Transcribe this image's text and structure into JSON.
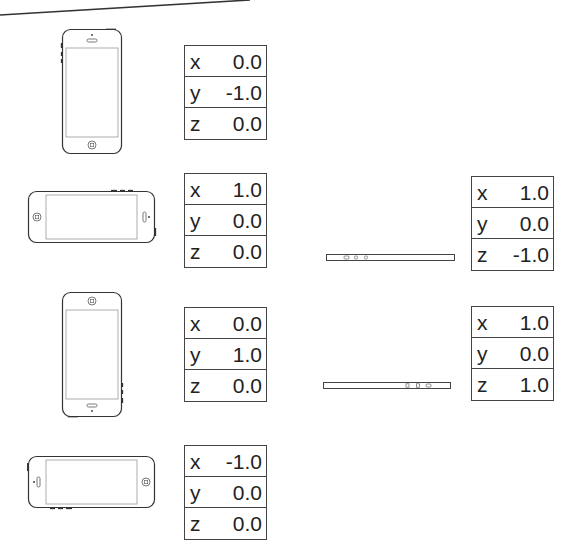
{
  "diagram": {
    "title": "",
    "colors": {
      "stroke": "#444444",
      "text": "#222222",
      "background": "#ffffff"
    },
    "orientations": [
      {
        "id": "portrait",
        "device_icon": "phone-portrait-icon",
        "vector": {
          "x": "0.0",
          "y": "-1.0",
          "z": "0.0"
        }
      },
      {
        "id": "landscape-left",
        "device_icon": "phone-landscape-home-left-icon",
        "vector": {
          "x": "1.0",
          "y": "0.0",
          "z": "0.0"
        }
      },
      {
        "id": "portrait-upside-down",
        "device_icon": "phone-portrait-upside-down-icon",
        "vector": {
          "x": "0.0",
          "y": "1.0",
          "z": "0.0"
        }
      },
      {
        "id": "landscape-right",
        "device_icon": "phone-landscape-home-right-icon",
        "vector": {
          "x": "-1.0",
          "y": "0.0",
          "z": "0.0"
        }
      },
      {
        "id": "face-up",
        "device_icon": "phone-flat-face-up-icon",
        "vector": {
          "x": "1.0",
          "y": "0.0",
          "z": "-1.0"
        }
      },
      {
        "id": "face-down",
        "device_icon": "phone-flat-face-down-icon",
        "vector": {
          "x": "1.0",
          "y": "0.0",
          "z": "1.0"
        }
      }
    ],
    "axis_labels": {
      "x": "x",
      "y": "y",
      "z": "z"
    }
  }
}
